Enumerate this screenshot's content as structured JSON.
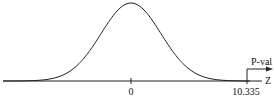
{
  "chart_data": {
    "type": "line",
    "title": "",
    "distribution": "standard normal",
    "axis_label": "Z",
    "tick_labels": [
      "0",
      "10.335"
    ],
    "ticks": [
      0,
      10.335
    ],
    "critical_value": 10.335,
    "tail": "right",
    "region_label": "P-val",
    "colors": {
      "curve": "#222222",
      "axis": "#222222"
    }
  }
}
